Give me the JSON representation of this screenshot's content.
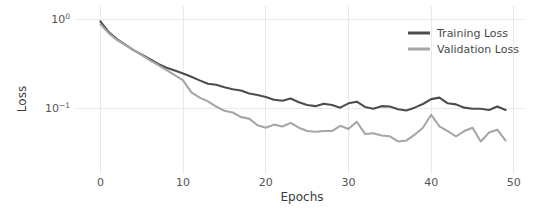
{
  "chart_data": {
    "type": "line",
    "title": "",
    "xlabel": "Epochs",
    "ylabel": "Loss",
    "yscale": "log",
    "xlim": [
      -1.5,
      50.5
    ],
    "ylim": [
      0.02,
      1.15
    ],
    "grid": true,
    "legend_position": "top-right",
    "xticks": [
      0,
      10,
      20,
      30,
      40,
      50
    ],
    "xtick_labels": [
      "0",
      "10",
      "20",
      "30",
      "40",
      "50"
    ],
    "yticks": [
      1.0,
      0.1
    ],
    "ytick_labels": [
      "10⁰",
      "10⁻¹"
    ],
    "ytick_mantissa": [
      "10",
      "10"
    ],
    "ytick_exponents": [
      "0",
      "-1"
    ],
    "x": [
      0,
      1,
      2,
      3,
      4,
      5,
      6,
      7,
      8,
      9,
      10,
      11,
      12,
      13,
      14,
      15,
      16,
      17,
      18,
      19,
      20,
      21,
      22,
      23,
      24,
      25,
      26,
      27,
      28,
      29,
      30,
      31,
      32,
      33,
      34,
      35,
      36,
      37,
      38,
      39,
      40,
      41,
      42,
      43,
      44,
      45,
      46,
      47,
      48,
      49
    ],
    "series": [
      {
        "name": "Training Loss",
        "color": "#4d4d4d",
        "linewidth": 2.1,
        "values": [
          0.95,
          0.72,
          0.6,
          0.52,
          0.45,
          0.4,
          0.355,
          0.315,
          0.285,
          0.265,
          0.245,
          0.225,
          0.205,
          0.188,
          0.183,
          0.172,
          0.163,
          0.158,
          0.146,
          0.14,
          0.133,
          0.124,
          0.121,
          0.128,
          0.116,
          0.108,
          0.105,
          0.112,
          0.108,
          0.101,
          0.113,
          0.118,
          0.103,
          0.098,
          0.105,
          0.104,
          0.097,
          0.094,
          0.101,
          0.111,
          0.126,
          0.131,
          0.113,
          0.11,
          0.101,
          0.098,
          0.098,
          0.095,
          0.104,
          0.095
        ]
      },
      {
        "name": "Validation Loss",
        "color": "#a6a6a6",
        "linewidth": 2.1,
        "values": [
          0.88,
          0.7,
          0.585,
          0.515,
          0.45,
          0.395,
          0.345,
          0.305,
          0.268,
          0.235,
          0.205,
          0.15,
          0.131,
          0.119,
          0.104,
          0.093,
          0.089,
          0.079,
          0.076,
          0.064,
          0.06,
          0.065,
          0.062,
          0.068,
          0.06,
          0.055,
          0.054,
          0.055,
          0.055,
          0.063,
          0.058,
          0.07,
          0.051,
          0.052,
          0.049,
          0.048,
          0.042,
          0.043,
          0.05,
          0.06,
          0.084,
          0.062,
          0.055,
          0.048,
          0.055,
          0.06,
          0.042,
          0.053,
          0.057,
          0.043
        ]
      }
    ]
  },
  "legend": {
    "items": [
      {
        "label": "Training Loss",
        "color": "#4d4d4d"
      },
      {
        "label": "Validation Loss",
        "color": "#a6a6a6"
      }
    ]
  }
}
